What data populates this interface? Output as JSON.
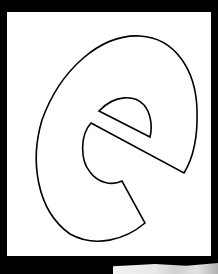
{
  "page": {
    "background_color": "#000000",
    "panel_color": "#ffffff",
    "stroke_color": "#000000"
  },
  "letter": {
    "character": "e",
    "style": "outline",
    "icon": "letter-e-outline-icon"
  }
}
